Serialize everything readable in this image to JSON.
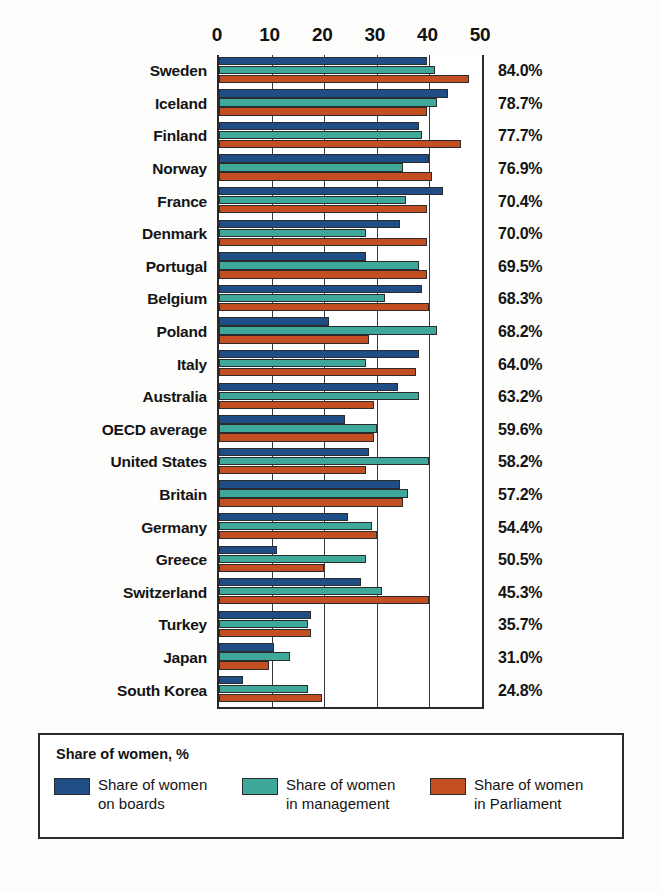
{
  "chart_data": {
    "type": "bar",
    "orientation": "horizontal",
    "title": "",
    "xlabel": "",
    "ylabel": "",
    "xlim": [
      0,
      50
    ],
    "xticks": [
      0,
      10,
      20,
      30,
      40,
      50
    ],
    "xtick_labels": [
      "0",
      "10",
      "20",
      "30",
      "40",
      "50"
    ],
    "grid": true,
    "legend_position": "bottom",
    "legend_title": "Share of women, %",
    "categories": [
      "Sweden",
      "Iceland",
      "Finland",
      "Norway",
      "France",
      "Denmark",
      "Portugal",
      "Belgium",
      "Poland",
      "Italy",
      "Australia",
      "OECD average",
      "United States",
      "Britain",
      "Germany",
      "Greece",
      "Switzerland",
      "Turkey",
      "Japan",
      "South Korea"
    ],
    "series": [
      {
        "name": "Share of women\non boards",
        "color": "#1f4e87",
        "values": [
          39.5,
          43.5,
          38.0,
          40.0,
          42.5,
          34.5,
          28.0,
          38.5,
          21.0,
          38.0,
          34.0,
          24.0,
          28.5,
          34.5,
          24.5,
          11.0,
          27.0,
          17.5,
          10.5,
          4.5
        ]
      },
      {
        "name": "Share of women\nin management",
        "color": "#3ea89b",
        "values": [
          41.0,
          41.5,
          38.5,
          35.0,
          35.5,
          28.0,
          38.0,
          31.5,
          41.5,
          28.0,
          38.0,
          30.0,
          40.0,
          36.0,
          29.0,
          28.0,
          31.0,
          17.0,
          13.5,
          17.0
        ]
      },
      {
        "name": "Share of women\nin Parliament",
        "color": "#c24e22",
        "values": [
          47.5,
          39.5,
          46.0,
          40.5,
          39.5,
          39.5,
          39.5,
          40.0,
          28.5,
          37.5,
          29.5,
          29.5,
          28.0,
          35.0,
          30.0,
          20.0,
          40.0,
          17.5,
          9.5,
          19.5
        ]
      }
    ],
    "annotations": {
      "right_column_label": "composite score",
      "right_values": [
        "84.0%",
        "78.7%",
        "77.7%",
        "76.9%",
        "70.4%",
        "70.0%",
        "69.5%",
        "68.3%",
        "68.2%",
        "64.0%",
        "63.2%",
        "59.6%",
        "58.2%",
        "57.2%",
        "54.4%",
        "50.5%",
        "45.3%",
        "35.7%",
        "31.0%",
        "24.8%"
      ]
    }
  },
  "legend": {
    "title": "Share of women, %",
    "items": [
      {
        "label": "Share of women\non boards",
        "color": "#1f4e87"
      },
      {
        "label": "Share of women\nin management",
        "color": "#3ea89b"
      },
      {
        "label": "Share of women\nin Parliament",
        "color": "#c24e22"
      }
    ]
  },
  "colors": {
    "series_boards": "#1f4e87",
    "series_management": "#3ea89b",
    "series_parliament": "#c24e22",
    "axis": "#2a2a2a",
    "background": "#ffffff"
  }
}
